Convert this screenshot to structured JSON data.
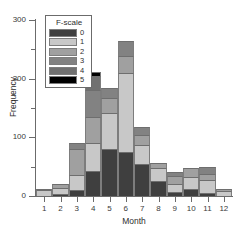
{
  "chart_data": {
    "type": "bar",
    "stacked": true,
    "title": "",
    "xlabel": "Month",
    "ylabel": "Frequency",
    "categories": [
      "1",
      "2",
      "3",
      "4",
      "5",
      "6",
      "7",
      "8",
      "9",
      "10",
      "11",
      "12"
    ],
    "ylim": [
      0,
      300
    ],
    "ytick_labels": [
      "0",
      "100",
      "200",
      "300"
    ],
    "ytick_values": [
      0,
      100,
      200,
      300
    ],
    "yminor_values": [
      50,
      150,
      250
    ],
    "grid": false,
    "legend_title": "F-scale",
    "legend_position": "top-left-inside",
    "series": [
      {
        "name": "0",
        "color": "#3f3f3f",
        "values": [
          0,
          4,
          10,
          42,
          80,
          75,
          54,
          26,
          7,
          12,
          5,
          0
        ]
      },
      {
        "name": "1",
        "color": "#c8c8c8",
        "values": [
          11,
          9,
          25,
          48,
          62,
          135,
          33,
          22,
          14,
          20,
          22,
          8
        ]
      },
      {
        "name": "2",
        "color": "#a0a0a0",
        "values": [
          1,
          7,
          45,
          45,
          25,
          28,
          17,
          9,
          14,
          15,
          11,
          4
        ]
      },
      {
        "name": "3",
        "color": "#828282",
        "values": [
          0,
          0,
          10,
          45,
          18,
          27,
          13,
          0,
          6,
          0,
          12,
          0
        ]
      },
      {
        "name": "4",
        "color": "#707070",
        "values": [
          0,
          0,
          0,
          25,
          0,
          0,
          0,
          0,
          0,
          0,
          0,
          0
        ]
      },
      {
        "name": "5",
        "color": "#000000",
        "values": [
          0,
          0,
          0,
          7,
          0,
          0,
          0,
          0,
          0,
          0,
          0,
          0
        ]
      }
    ],
    "totals": [
      12,
      20,
      90,
      212,
      185,
      265,
      117,
      57,
      41,
      47,
      50,
      12
    ]
  },
  "axis": {
    "x_title": "Month",
    "y_title": "Frequency"
  },
  "legend": {
    "title": "F-scale",
    "entries": [
      {
        "label": "0",
        "color": "#3f3f3f"
      },
      {
        "label": "1",
        "color": "#c8c8c8"
      },
      {
        "label": "2",
        "color": "#a0a0a0"
      },
      {
        "label": "3",
        "color": "#828282"
      },
      {
        "label": "4",
        "color": "#707070"
      },
      {
        "label": "5",
        "color": "#000000"
      }
    ]
  }
}
